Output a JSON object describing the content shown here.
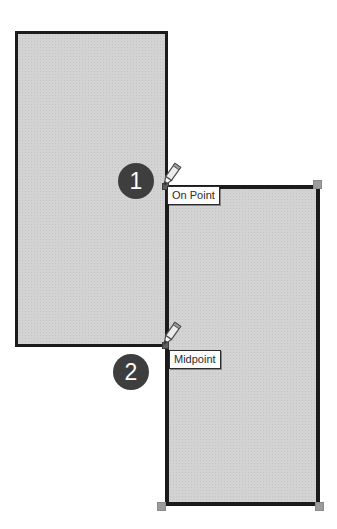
{
  "figure": {
    "background_color": "#ffffff"
  },
  "shapes": {
    "left_rectangle": {
      "fill": "#d3d3d3",
      "border_color": "#1b1b1b"
    },
    "right_rectangle": {
      "fill": "#d3d3d3",
      "border_color": "#1b1b1b",
      "selected": true
    },
    "handle_color": "#9c9c9c",
    "snap_marker_color": "#5f5f5f"
  },
  "callouts": [
    {
      "number": "1",
      "background": "#3e3e3e",
      "text_color": "#ffffff"
    },
    {
      "number": "2",
      "background": "#3e3e3e",
      "text_color": "#ffffff"
    }
  ],
  "snap_tooltips": [
    {
      "label": "On Point",
      "background": "#fcfcfc",
      "border_color": "#2a2a2a",
      "text_color": "#2e2e2e"
    },
    {
      "label": "Midpoint",
      "background": "#fcfcfc",
      "border_color": "#2a2a2a",
      "text_color": "#2e2e2e"
    }
  ],
  "cursors": [
    {
      "icon": "pencil-icon",
      "at": "On Point snap"
    },
    {
      "icon": "pencil-icon",
      "at": "Midpoint snap"
    }
  ]
}
